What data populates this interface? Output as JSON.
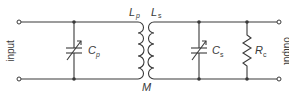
{
  "diagram": {
    "type": "transformer-coupled tuned circuit",
    "colors": {
      "stroke": "#3a3a3a",
      "background": "#ffffff"
    },
    "labels": {
      "input": "input",
      "output": "output",
      "Cp_main": "C",
      "Cp_sub": "p",
      "Cs_main": "C",
      "Cs_sub": "s",
      "Rc_main": "R",
      "Rc_sub": "c",
      "Lp_main": "L",
      "Lp_sub": "p",
      "Ls_main": "L",
      "Ls_sub": "s",
      "M": "M"
    },
    "components": [
      {
        "id": "Cp",
        "kind": "variable capacitor",
        "side": "primary"
      },
      {
        "id": "Lp",
        "kind": "inductor",
        "side": "primary"
      },
      {
        "id": "Ls",
        "kind": "inductor",
        "side": "secondary"
      },
      {
        "id": "Cs",
        "kind": "variable capacitor",
        "side": "secondary"
      },
      {
        "id": "Rc",
        "kind": "resistor",
        "side": "secondary"
      }
    ]
  }
}
